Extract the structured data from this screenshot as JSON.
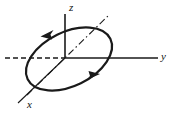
{
  "figure": {
    "caption": "",
    "background_color": "#ffffff",
    "stroke_color": "#1a1a1a",
    "width": 175,
    "height": 117
  },
  "axes": {
    "origin": {
      "x": 65,
      "y": 58
    },
    "z": {
      "label": "z",
      "name": "z-axis",
      "orientation": "vertical-up",
      "style": "solid",
      "from": {
        "x": 65,
        "y": 14
      },
      "to": {
        "x": 65,
        "y": 58
      }
    },
    "y": {
      "label": "y",
      "name": "y-axis",
      "orientation": "horizontal-right",
      "style": "solid",
      "from": {
        "x": 65,
        "y": 58
      },
      "to": {
        "x": 158,
        "y": 58
      }
    },
    "y_negative": {
      "label": "",
      "name": "y-axis-negative",
      "orientation": "horizontal-left",
      "style": "dashed",
      "from": {
        "x": 65,
        "y": 58
      },
      "to": {
        "x": 5,
        "y": 58
      }
    },
    "x": {
      "label": "x",
      "name": "x-axis",
      "orientation": "diagonal-lower-left",
      "style": "solid",
      "from": {
        "x": 65,
        "y": 58
      },
      "to": {
        "x": 18,
        "y": 103
      }
    }
  },
  "orbit": {
    "name": "orbit-ellipse",
    "shape": "ellipse",
    "center": {
      "x": 69,
      "y": 59
    },
    "radius_x": 46,
    "radius_y": 27,
    "rotation_deg": -26,
    "style": "solid",
    "direction": "counterclockwise",
    "arrows": [
      {
        "name": "orbit-arrow-upper-left",
        "tip": {
          "x": 41,
          "y": 36
        },
        "points": "down-left"
      },
      {
        "name": "orbit-arrow-lower-right",
        "tip": {
          "x": 99,
          "y": 75
        },
        "points": "up-right"
      }
    ]
  },
  "major_axis_line": {
    "name": "orbit-major-axis",
    "style": "dash-dot",
    "from": {
      "x": 27,
      "y": 95
    },
    "to": {
      "x": 110,
      "y": 14
    }
  }
}
